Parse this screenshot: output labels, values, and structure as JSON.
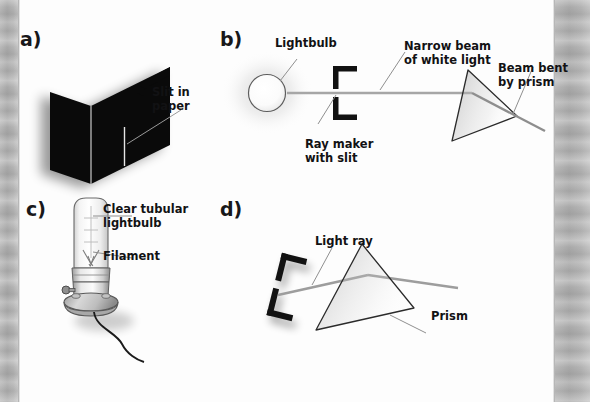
{
  "figure": {
    "background_color": "#fdfdfd",
    "gutter_color": "#b4b4b4",
    "ink_color": "#121214",
    "ray_color": "#9a9a9a"
  },
  "panels": [
    {
      "id": "a",
      "letter": "a)",
      "subject": "slit-in-paper",
      "labels": [
        {
          "name": "slit-in-paper-label",
          "text": "Slit in\npaper"
        }
      ]
    },
    {
      "id": "b",
      "letter": "b)",
      "subject": "ray-maker-and-prism-setup",
      "labels": [
        {
          "name": "lightbulb-label",
          "text": "Lightbulb"
        },
        {
          "name": "narrow-beam-label",
          "text": "Narrow beam\nof white light"
        },
        {
          "name": "beam-bent-label",
          "text": "Beam bent\nby prism"
        },
        {
          "name": "ray-maker-label",
          "text": "Ray maker\nwith slit"
        }
      ]
    },
    {
      "id": "c",
      "letter": "c)",
      "subject": "clear-tubular-lightbulb-on-stand",
      "labels": [
        {
          "name": "clear-tubular-lightbulb-label",
          "text": "Clear tubular\nlightbulb"
        },
        {
          "name": "filament-label",
          "text": "Filament"
        }
      ]
    },
    {
      "id": "d",
      "letter": "d)",
      "subject": "light-ray-through-prism",
      "labels": [
        {
          "name": "light-ray-label",
          "text": "Light ray"
        },
        {
          "name": "prism-label",
          "text": "Prism"
        }
      ]
    }
  ]
}
